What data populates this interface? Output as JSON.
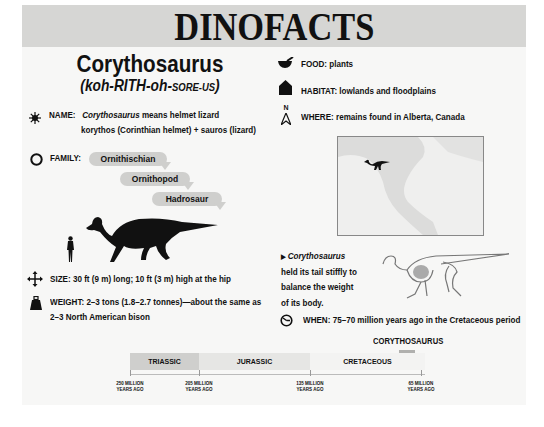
{
  "header": {
    "title": "DINOFACTS"
  },
  "dinosaur": {
    "name": "Corythosaurus",
    "pronunciation": {
      "part1": "(koh-RITH-oh-",
      "part2": "SORE-US",
      "part3": ")"
    }
  },
  "facts": {
    "name": {
      "label": "NAME:",
      "italic": "Corythosaurus",
      "line1_rest": " means helmet lizard",
      "line2": "korythos (Corinthian helmet) + sauros (lizard)",
      "icon": "sunburst-icon"
    },
    "family": {
      "label": "FAMILY:",
      "levels": [
        "Ornithischian",
        "Ornithopod",
        "Hadrosaur"
      ],
      "icon": "circle-icon"
    },
    "size": {
      "text": "SIZE: 30 ft (9 m) long; 10 ft (3 m) high at the hip",
      "icon": "move-arrows-icon"
    },
    "weight": {
      "line1": "WEIGHT: 2–3 tons (1.8–2.7 tonnes)—about the same as",
      "line2": "2–3 North American bison",
      "icon": "weight-icon"
    },
    "food": {
      "text": "FOOD: plants",
      "icon": "mortar-pestle-icon"
    },
    "habitat": {
      "text": "HABITAT: lowlands and floodplains",
      "icon": "house-icon"
    },
    "where": {
      "text": "WHERE: remains found in Alberta, Canada",
      "icon": "compass-north-icon",
      "north": "N"
    },
    "when": {
      "text": "WHEN: 75–70 million years ago in the Cretaceous period",
      "icon": "clock-icon"
    }
  },
  "caption": {
    "italic": "Corythosaurus",
    "line1_rest": "",
    "line2": "held its tail stiffly to",
    "line3": "balance the weight",
    "line4": "of its body."
  },
  "timeline": {
    "marker_label": "CORYTHOSAURUS",
    "periods": [
      {
        "name": "TRIASSIC",
        "color": "#cfcfcd"
      },
      {
        "name": "JURASSIC",
        "color": "#e6e6e4"
      },
      {
        "name": "CRETACEOUS",
        "color": "#f3f3f2"
      }
    ],
    "ticks": [
      {
        "line1": "250 MILLION",
        "line2": "YEARS AGO"
      },
      {
        "line1": "205 MILLION",
        "line2": "YEARS AGO"
      },
      {
        "line1": "135 MILLION",
        "line2": "YEARS AGO"
      },
      {
        "line1": "65 MILLION",
        "line2": "YEARS AGO"
      }
    ]
  }
}
